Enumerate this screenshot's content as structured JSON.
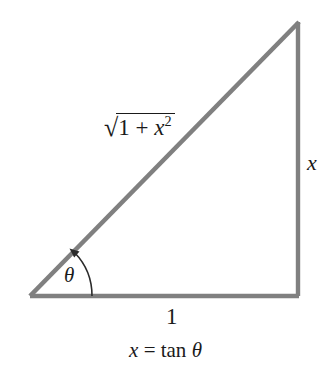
{
  "figure": {
    "background_color": "#ffffff",
    "stroke_color": "#808080",
    "text_color": "#1a1a1a",
    "arc_color": "#2b2b2b",
    "stroke_width": 4
  },
  "triangle": {
    "vertices": {
      "left": {
        "x": 30,
        "y": 296
      },
      "bottom_right": {
        "x": 298,
        "y": 296
      },
      "apex": {
        "x": 298,
        "y": 22
      }
    }
  },
  "labels": {
    "hypotenuse": {
      "radical_sign": "√",
      "radicand_first": "1",
      "radicand_op": " + ",
      "radicand_var": "x",
      "radicand_exponent": "2",
      "plain": "√(1 + x²)"
    },
    "opposite": "x",
    "adjacent": "1",
    "angle": "θ"
  },
  "caption": {
    "variable": "x",
    "equals": "=",
    "function": "tan",
    "angle": "θ",
    "plain": "x = tan θ"
  }
}
